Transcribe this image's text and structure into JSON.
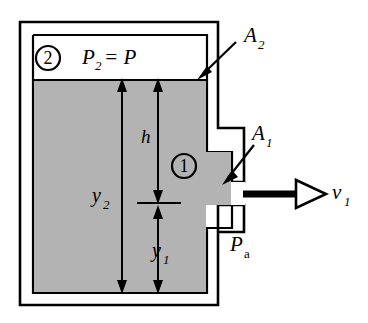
{
  "figure": {
    "colors": {
      "fluid_fill": "#b3b3b3",
      "stroke": "#000000",
      "background": "#ffffff",
      "arrow_fill": "#000000",
      "nozzle_arrow_head_fill": "#ffffff"
    }
  },
  "labels": {
    "point2_marker": "2",
    "pressure_top": "P",
    "pressure_top_sub": "2",
    "pressure_top_eq": "= P",
    "area_top": "A",
    "area_top_sub": "2",
    "area_nozzle": "A",
    "area_nozzle_sub": "1",
    "point1_marker": "1",
    "height_h": "h",
    "height_y2": "y",
    "height_y2_sub": "2",
    "height_y1": "y",
    "height_y1_sub": "1",
    "pressure_ambient": "P",
    "pressure_ambient_sub": "a",
    "velocity": "v",
    "velocity_sub": "1"
  }
}
